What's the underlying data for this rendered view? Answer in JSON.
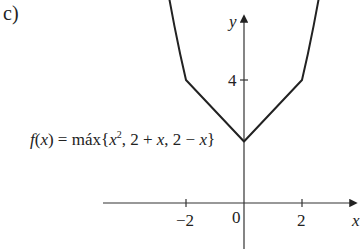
{
  "part_label": "c)",
  "formula": {
    "lhs": "f(x)",
    "equals": " = ",
    "text": "f(x) = máx{x², 2 + x, 2 − x}"
  },
  "axes": {
    "x_label": "x",
    "y_label": "y",
    "origin_label": "0",
    "x_ticks": [
      "−2",
      "2"
    ],
    "y_ticks": [
      "4"
    ]
  },
  "chart_data": {
    "type": "line",
    "xlabel": "x",
    "ylabel": "y",
    "x_ticks": [
      -2,
      0,
      2
    ],
    "y_ticks": [
      4
    ],
    "series": [
      {
        "name": "f(x) = max{x², 2 + x, 2 − x}",
        "points": [
          {
            "x": -2.6,
            "y": 6.76
          },
          {
            "x": -2.4,
            "y": 5.76
          },
          {
            "x": -2.2,
            "y": 4.84
          },
          {
            "x": -2,
            "y": 4
          },
          {
            "x": 0,
            "y": 2
          },
          {
            "x": 2,
            "y": 4
          },
          {
            "x": 2.2,
            "y": 4.84
          },
          {
            "x": 2.4,
            "y": 5.76
          },
          {
            "x": 2.6,
            "y": 6.76
          }
        ]
      }
    ],
    "key_points": [
      {
        "x": -2,
        "y": 4
      },
      {
        "x": 0,
        "y": 2
      },
      {
        "x": 2,
        "y": 4
      }
    ],
    "grid": false,
    "legend": "none"
  }
}
